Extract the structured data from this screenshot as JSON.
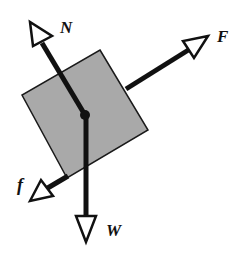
{
  "diagram": {
    "type": "free-body-diagram",
    "block": {
      "fill": "#a9a9a9",
      "stroke": "#1a1a1a",
      "corners": [
        [
          100,
          50
        ],
        [
          148,
          130
        ],
        [
          67,
          178
        ],
        [
          22,
          95
        ]
      ]
    },
    "center": [
      85,
      115
    ],
    "forces": [
      {
        "id": "N",
        "label": "N",
        "meaning": "normal force",
        "tip": [
          30,
          22
        ],
        "label_pos": [
          60,
          33
        ]
      },
      {
        "id": "F",
        "label": "F",
        "meaning": "applied force",
        "tip": [
          208,
          36
        ],
        "label_pos": [
          217,
          42
        ]
      },
      {
        "id": "f",
        "label": "f",
        "meaning": "friction force",
        "tip": [
          30,
          201
        ],
        "label_pos": [
          17,
          191
        ]
      },
      {
        "id": "W",
        "label": "W",
        "meaning": "weight",
        "tip": [
          86,
          242
        ],
        "label_pos": [
          107,
          236
        ]
      }
    ]
  }
}
